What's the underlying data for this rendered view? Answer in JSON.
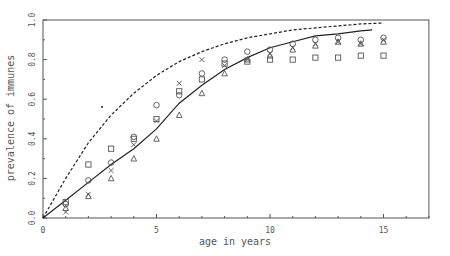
{
  "chart_data": {
    "type": "line",
    "title": "",
    "xlabel": "age in years",
    "ylabel": "prevalence of immunes",
    "xlim": [
      0,
      17
    ],
    "ylim": [
      0,
      1.0
    ],
    "xticks": [
      0,
      5,
      10,
      15
    ],
    "yticks": [
      0.0,
      0.2,
      0.4,
      0.6,
      0.8,
      1.0
    ],
    "ytick_labels": [
      "0.0",
      "0.2",
      "0.4",
      "0.6",
      "0.8",
      "1.0"
    ],
    "xtick_labels": [
      "0",
      "5",
      "10",
      "15"
    ],
    "grid": false,
    "legend": null,
    "series": [
      {
        "name": "fitted-solid",
        "style": "solid",
        "x": [
          0,
          1,
          2,
          3,
          4,
          5,
          6,
          7,
          8,
          9,
          10,
          11,
          12,
          13,
          14,
          14.5
        ],
        "values": [
          0,
          0.09,
          0.18,
          0.27,
          0.35,
          0.45,
          0.58,
          0.67,
          0.75,
          0.81,
          0.86,
          0.89,
          0.92,
          0.93,
          0.945,
          0.95
        ]
      },
      {
        "name": "fitted-dashed",
        "style": "dashed",
        "x": [
          0,
          1,
          2,
          3,
          4,
          5,
          6,
          7,
          8,
          9,
          10,
          11,
          12,
          13,
          14,
          15
        ],
        "values": [
          0,
          0.2,
          0.38,
          0.52,
          0.63,
          0.72,
          0.79,
          0.84,
          0.88,
          0.91,
          0.93,
          0.95,
          0.96,
          0.97,
          0.98,
          0.985
        ]
      },
      {
        "name": "circles",
        "marker": "circle",
        "x": [
          1,
          2,
          3,
          4,
          5,
          6,
          7,
          8,
          9,
          10,
          11,
          12,
          13,
          14,
          15
        ],
        "values": [
          0.07,
          0.19,
          0.28,
          0.41,
          0.57,
          0.62,
          0.73,
          0.8,
          0.84,
          0.85,
          0.88,
          0.9,
          0.91,
          0.9,
          0.91
        ]
      },
      {
        "name": "squares",
        "marker": "square",
        "x": [
          1,
          2,
          3,
          4,
          5,
          6,
          7,
          8,
          9,
          10,
          11,
          12,
          13,
          14,
          15
        ],
        "values": [
          0.08,
          0.27,
          0.35,
          0.4,
          0.5,
          0.64,
          0.7,
          0.78,
          0.79,
          0.8,
          0.8,
          0.81,
          0.81,
          0.82,
          0.82
        ]
      },
      {
        "name": "crosses",
        "marker": "cross",
        "x": [
          1,
          2,
          3,
          4,
          5,
          6,
          7,
          8,
          9,
          10,
          11,
          12,
          13,
          14,
          15
        ],
        "values": [
          0.03,
          0.12,
          0.24,
          0.37,
          0.49,
          0.68,
          0.8,
          0.77,
          0.8,
          0.83,
          0.86,
          0.88,
          0.89,
          0.88,
          0.9
        ]
      },
      {
        "name": "triangles",
        "marker": "triangle",
        "x": [
          1,
          2,
          3,
          4,
          5,
          6,
          7,
          8,
          9,
          10,
          11,
          12,
          13,
          14,
          15
        ],
        "values": [
          0.05,
          0.11,
          0.2,
          0.3,
          0.4,
          0.52,
          0.63,
          0.73,
          0.8,
          0.82,
          0.85,
          0.87,
          0.89,
          0.88,
          0.89
        ]
      }
    ],
    "annotations": [
      {
        "x": 2.6,
        "y": 0.56,
        "text": "."
      }
    ]
  },
  "colors": {
    "axis": "#555555",
    "line": "#222222",
    "marker": "#555555"
  }
}
